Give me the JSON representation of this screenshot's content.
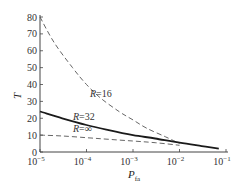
{
  "chart_data": {
    "type": "line",
    "title": "",
    "xlabel": "P",
    "xlabel_sub": "fa",
    "ylabel": "T",
    "xscale": "log",
    "xlim": [
      1e-05,
      0.1
    ],
    "ylim": [
      0,
      80
    ],
    "grid": false,
    "legend": "inline labels",
    "x_ticks": [
      1e-05,
      0.0001,
      0.001,
      0.01,
      0.1
    ],
    "x_tick_labels": [
      {
        "base": "10",
        "exp": "−5"
      },
      {
        "base": "10",
        "exp": "−4"
      },
      {
        "base": "10",
        "exp": "−3"
      },
      {
        "base": "10",
        "exp": "−2"
      },
      {
        "base": "10",
        "exp": "−1"
      }
    ],
    "y_ticks": [
      0,
      10,
      20,
      30,
      40,
      50,
      60,
      70,
      80
    ],
    "y_tick_labels": [
      "0",
      "10",
      "20",
      "30",
      "40",
      "50",
      "60",
      "70",
      "80"
    ],
    "series": [
      {
        "name": "R=16",
        "label_R": "R",
        "label_val": "=16",
        "style": "dashed",
        "x": [
          1e-05,
          2e-05,
          5e-05,
          0.0001,
          0.0002,
          0.0005,
          0.001,
          0.002,
          0.005,
          0.01
        ],
        "values": [
          80,
          65,
          50,
          40,
          32,
          24,
          19,
          14,
          9,
          5
        ]
      },
      {
        "name": "R=32",
        "label_R": "R",
        "label_val": "=32",
        "style": "solid",
        "x": [
          1e-05,
          3e-05,
          0.0001,
          0.0003,
          0.001,
          0.003,
          0.01,
          0.03,
          0.07
        ],
        "values": [
          24,
          20,
          16,
          13,
          10,
          8,
          5.5,
          3.5,
          2
        ]
      },
      {
        "name": "R=∞",
        "label_R": "R",
        "label_val": "=∞",
        "style": "dashed",
        "x": [
          1e-05,
          3e-05,
          0.0001,
          0.0003,
          0.001,
          0.003,
          0.01
        ],
        "values": [
          10,
          9.5,
          8.5,
          7.5,
          6.5,
          5.5,
          4
        ]
      }
    ]
  }
}
